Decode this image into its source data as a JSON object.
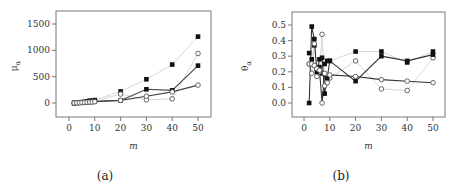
{
  "chart_data": [
    {
      "id": "a",
      "type": "line",
      "caption": "(a)",
      "xlabel": "m",
      "ylabel": "μ_α",
      "ylabel_main": "μ",
      "ylabel_sub": "α",
      "xlim": [
        -5,
        55
      ],
      "ylim": [
        -250,
        1750
      ],
      "xticks": [
        0,
        10,
        20,
        30,
        40,
        50
      ],
      "yticks": [
        0,
        500,
        1000,
        1500
      ],
      "grid": false,
      "legend": null,
      "x": [
        2,
        3,
        4,
        5,
        6,
        7,
        8,
        9,
        10,
        20,
        30,
        40,
        50
      ],
      "series": [
        {
          "name": "filled-light",
          "marker": "square-filled",
          "line_color": "#d8d8d8",
          "values": [
            0,
            5,
            10,
            15,
            20,
            30,
            45,
            40,
            55,
            220,
            450,
            730,
            1260
          ]
        },
        {
          "name": "filled-dark",
          "marker": "square-filled",
          "line_color": "#444444",
          "values": [
            0,
            4,
            8,
            12,
            16,
            20,
            30,
            28,
            35,
            50,
            260,
            240,
            710
          ]
        },
        {
          "name": "open-light",
          "marker": "circle-open",
          "line_color": "#d8d8d8",
          "values": [
            0,
            3,
            6,
            10,
            14,
            18,
            22,
            20,
            30,
            170,
            60,
            80,
            940
          ]
        },
        {
          "name": "open-dark",
          "marker": "circle-open",
          "line_color": "#444444",
          "values": [
            0,
            3,
            5,
            8,
            12,
            15,
            18,
            20,
            25,
            50,
            130,
            210,
            340
          ]
        }
      ]
    },
    {
      "id": "b",
      "type": "line",
      "caption": "(b)",
      "xlabel": "m",
      "ylabel": "θ_α",
      "ylabel_main": "θ",
      "ylabel_sub": "α",
      "xlim": [
        -5,
        55
      ],
      "ylim": [
        -0.08,
        0.57
      ],
      "xticks": [
        0,
        10,
        20,
        30,
        40,
        50
      ],
      "yticks": [
        0.0,
        0.1,
        0.2,
        0.3,
        0.4,
        0.5
      ],
      "ytick_labels": [
        "0.0",
        "0.1",
        "0.2",
        "0.3",
        "0.4",
        "0.5"
      ],
      "grid": false,
      "legend": null,
      "x": [
        2,
        3,
        4,
        5,
        6,
        7,
        8,
        9,
        10,
        20,
        30,
        40,
        50
      ],
      "series": [
        {
          "name": "filled-light",
          "marker": "square-filled",
          "line_color": "#d8d8d8",
          "values": [
            0.32,
            0.28,
            0.37,
            0.22,
            0.23,
            0.19,
            0.25,
            0.27,
            0.27,
            0.33,
            0.33,
            0.26,
            0.33
          ]
        },
        {
          "name": "open-light",
          "marker": "circle-open",
          "line_color": "#d8d8d8",
          "values": [
            0.25,
            0.19,
            0.38,
            0.17,
            0.2,
            0.44,
            0.11,
            0.18,
            0.16,
            0.27,
            0.09,
            0.08,
            0.29
          ]
        },
        {
          "name": "filled-dark",
          "marker": "square-filled",
          "line_color": "#333333",
          "values": [
            0.0,
            0.49,
            0.41,
            0.2,
            0.28,
            0.29,
            0.06,
            0.16,
            0.27,
            0.14,
            0.3,
            0.27,
            0.31
          ]
        },
        {
          "name": "open-dark",
          "marker": "circle-open",
          "line_color": "#333333",
          "values": [
            0.25,
            0.25,
            0.24,
            0.22,
            0.21,
            0.0,
            0.19,
            0.13,
            0.18,
            0.17,
            0.15,
            0.14,
            0.13
          ]
        }
      ]
    }
  ]
}
